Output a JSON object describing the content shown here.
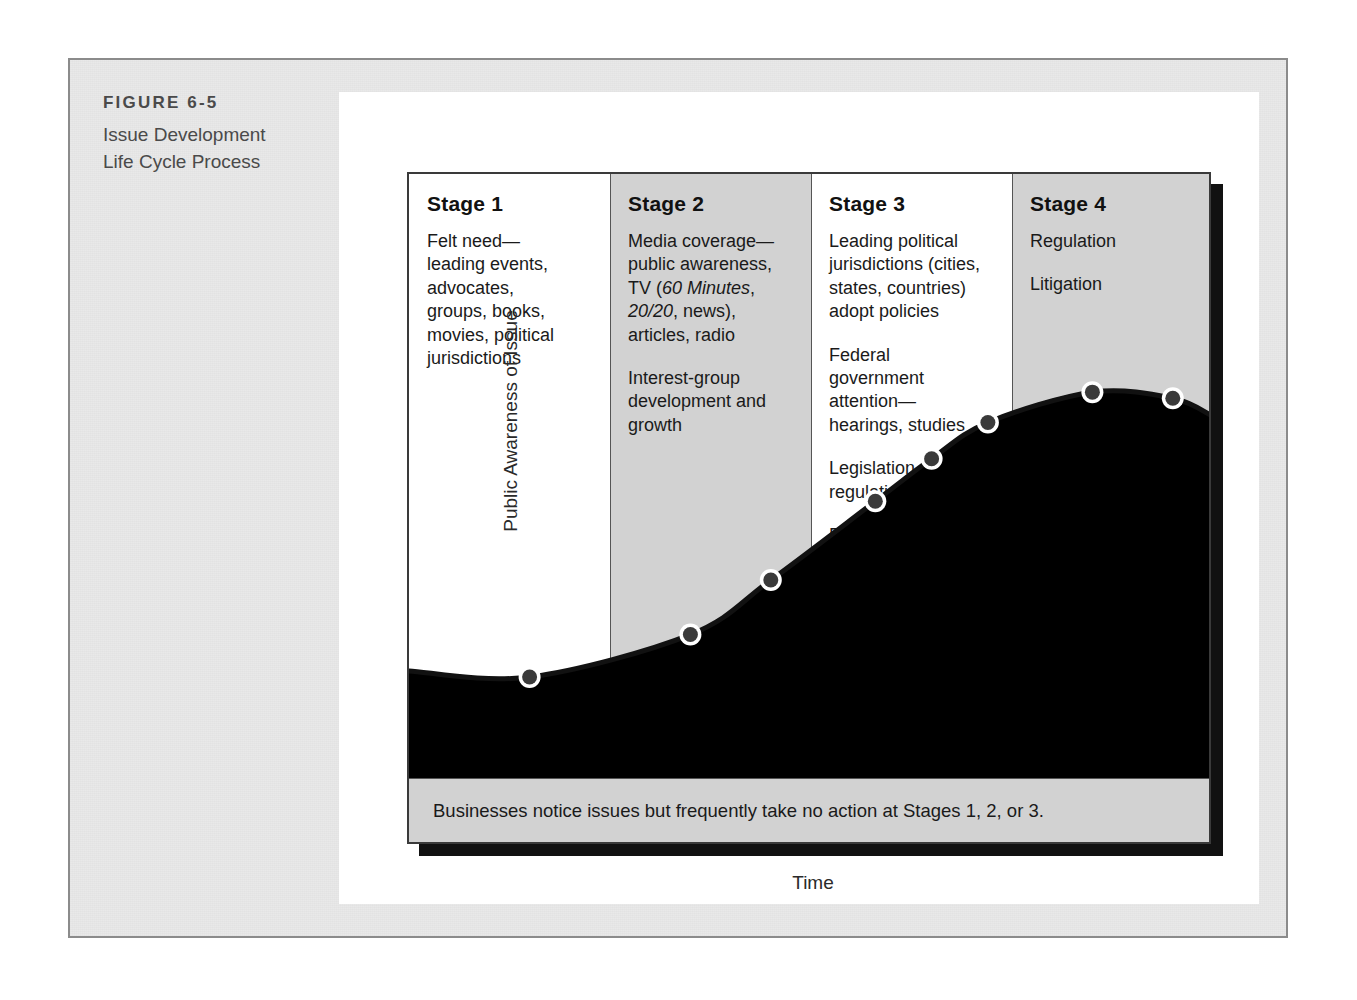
{
  "caption": {
    "figure_number": "FIGURE 6-5",
    "title_line_1": "Issue Development",
    "title_line_2": "Life Cycle Process"
  },
  "axes": {
    "y_label": "Public Awareness of Issue",
    "x_label": "Time"
  },
  "stages": [
    {
      "title": "Stage 1",
      "shaded": false,
      "blocks": [
        "Felt need—\nleading events,\nadvocates,\ngroups, books,\nmovies, political\njurisdictions"
      ]
    },
    {
      "title": "Stage 2",
      "shaded": true,
      "blocks": [
        "Media coverage—\npublic awareness,\nTV (60 Minutes,\n20/20, news),\narticles, radio",
        "Interest-group\ndevelopment and\ngrowth"
      ],
      "italic_terms": [
        "60 Minutes",
        "20/20"
      ]
    },
    {
      "title": "Stage 3",
      "shaded": false,
      "blocks": [
        "Leading political\njurisdictions (cities,\nstates, countries)\nadopt policies",
        "Federal\ngovernment\nattention—\nhearings, studies",
        "Legislation and\nregulation",
        "Businesses often\nbegin lobbying\naction if issues\nappear to be\nheaded to new\nlaws that may\nconstrain them."
      ]
    },
    {
      "title": "Stage 4",
      "shaded": true,
      "blocks": [
        "Regulation",
        "Litigation"
      ]
    }
  ],
  "bottom_note": "Businesses notice issues but frequently take no action at Stages 1, 2, or 3.",
  "chart_data": {
    "type": "line",
    "title": "Issue Development Life Cycle Process",
    "xlabel": "Time",
    "ylabel": "Public Awareness of Issue",
    "xlim": [
      0,
      100
    ],
    "ylim": [
      0,
      100
    ],
    "grid": false,
    "legend": null,
    "curve_shape": "s-curve rising then plateauing and slightly declining",
    "area_fill": "light gray shading below the curve",
    "line_color": "#111111",
    "marker_color": "#3a3a3a",
    "marker_halo_color": "#ffffff",
    "series": [
      {
        "name": "Public awareness",
        "x": [
          0,
          15,
          35,
          45,
          58,
          65,
          72,
          85,
          95,
          100
        ],
        "y": [
          18,
          17,
          24,
          33,
          46,
          53,
          59,
          64,
          63,
          60
        ]
      }
    ],
    "markers": [
      {
        "x": 15,
        "y": 17
      },
      {
        "x": 35,
        "y": 24
      },
      {
        "x": 45,
        "y": 33
      },
      {
        "x": 58,
        "y": 46
      },
      {
        "x": 65,
        "y": 53
      },
      {
        "x": 72,
        "y": 59
      },
      {
        "x": 85,
        "y": 64
      },
      {
        "x": 95,
        "y": 63
      }
    ],
    "stage_boundaries_x": [
      0,
      25,
      50,
      75,
      100
    ],
    "stage_labels": [
      "Stage 1",
      "Stage 2",
      "Stage 3",
      "Stage 4"
    ]
  },
  "colors": {
    "mat": "#e9e9e9",
    "panel": "#ffffff",
    "shaded_column": "#d2d2d2",
    "area_fill": "#cfcfcf",
    "line": "#111111",
    "frame_border": "#8b8b8b",
    "chart_border": "#3a3a3a",
    "shadow": "#111111",
    "caption_text": "#4a4a4a",
    "body_text": "#1a1a1a"
  }
}
